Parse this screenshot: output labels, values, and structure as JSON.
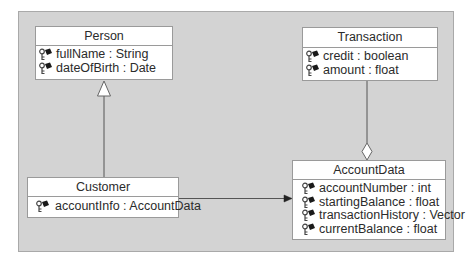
{
  "diagram": {
    "type": "UML class diagram",
    "background_color": "#d3d3d3",
    "classes": [
      {
        "id": "person",
        "name": "Person",
        "attributes": [
          {
            "label": "fullName : String",
            "icon": "private-attribute-icon"
          },
          {
            "label": "dateOfBirth : Date",
            "icon": "private-attribute-icon"
          }
        ]
      },
      {
        "id": "transaction",
        "name": "Transaction",
        "attributes": [
          {
            "label": "credit : boolean",
            "icon": "private-attribute-icon"
          },
          {
            "label": "amount : float",
            "icon": "private-attribute-icon"
          }
        ]
      },
      {
        "id": "customer",
        "name": "Customer",
        "attributes": [
          {
            "label": "accountInfo : AccountData",
            "icon": "private-attribute-icon"
          }
        ]
      },
      {
        "id": "accountdata",
        "name": "AccountData",
        "attributes": [
          {
            "label": "accountNumber : int",
            "icon": "private-attribute-icon"
          },
          {
            "label": "startingBalance : float",
            "icon": "private-attribute-icon"
          },
          {
            "label": "transactionHistory : Vector",
            "icon": "private-attribute-icon"
          },
          {
            "label": "currentBalance : float",
            "icon": "private-attribute-icon"
          }
        ]
      }
    ],
    "relationships": [
      {
        "type": "generalization",
        "from": "Customer",
        "to": "Person"
      },
      {
        "type": "aggregation",
        "from": "Transaction",
        "to": "AccountData"
      },
      {
        "type": "association",
        "from": "Customer",
        "to": "AccountData",
        "navigable": true
      }
    ]
  }
}
